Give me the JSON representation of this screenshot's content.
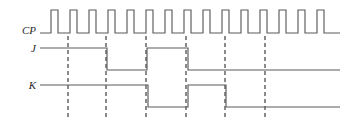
{
  "diagram": {
    "type": "digital-timing-waveform",
    "width": 354,
    "height": 124,
    "background_color": "#ffffff",
    "wave_color": "#5b5b5b",
    "marker_color": "#8a8a8a",
    "label_color": "#2b2b2b",
    "label_x": 36,
    "wave_start_x": 40,
    "wave_end_x": 340
  },
  "signals": [
    {
      "name": "CP",
      "label": "CP",
      "label_y": 31,
      "high_y": 10,
      "low_y": 33,
      "initial_level": 0,
      "transitions": [
        51,
        58,
        70,
        77,
        89,
        96,
        108,
        115,
        127,
        134,
        146,
        153,
        165,
        172,
        184,
        191,
        203,
        210,
        222,
        229,
        241,
        248,
        260,
        267,
        279,
        286,
        298,
        305,
        317,
        324
      ]
    },
    {
      "name": "J",
      "label": "J",
      "label_y": 49,
      "high_y": 48,
      "low_y": 70,
      "initial_level": 1,
      "transitions": [
        107,
        147,
        188
      ]
    },
    {
      "name": "K",
      "label": "K",
      "label_y": 86,
      "high_y": 85,
      "low_y": 107,
      "initial_level": 1,
      "transitions": [
        148,
        188,
        226
      ]
    }
  ],
  "markers": [
    {
      "id": "marker-1",
      "x": 68,
      "y_top": 36,
      "y_bottom": 119
    },
    {
      "id": "marker-2",
      "x": 106,
      "y_top": 36,
      "y_bottom": 119
    },
    {
      "id": "marker-3",
      "x": 146,
      "y_top": 36,
      "y_bottom": 119
    },
    {
      "id": "marker-4",
      "x": 186,
      "y_top": 36,
      "y_bottom": 119
    },
    {
      "id": "marker-5",
      "x": 225,
      "y_top": 36,
      "y_bottom": 119
    },
    {
      "id": "marker-6",
      "x": 265,
      "y_top": 36,
      "y_bottom": 119
    }
  ]
}
